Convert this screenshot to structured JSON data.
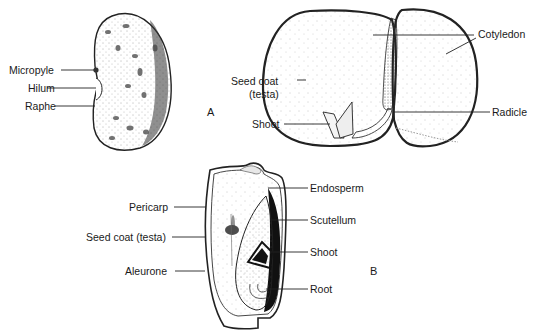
{
  "figure": {
    "panel_a_letter": "A",
    "panel_b_letter": "B"
  },
  "bean_exterior": {
    "labels": {
      "micropyle": "Micropyle",
      "hilum": "Hilum",
      "raphe": "Raphe"
    }
  },
  "bean_section": {
    "labels": {
      "cotyledon": "Cotyledon",
      "seed_coat_line1": "Seed coat",
      "seed_coat_line2": "(testa)",
      "shoot": "Shoot",
      "radicle": "Radicle"
    }
  },
  "grain_section": {
    "labels": {
      "endosperm": "Endosperm",
      "pericarp": "Pericarp",
      "scutellum": "Scutellum",
      "seed_coat": "Seed coat (testa)",
      "shoot": "Shoot",
      "aleurone": "Aleurone",
      "root": "Root"
    }
  },
  "colors": {
    "ink": "#1a1a1a",
    "background": "#ffffff"
  }
}
